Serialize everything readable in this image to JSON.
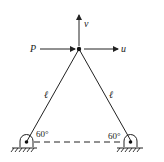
{
  "diagram": {
    "labels": {
      "v": "v",
      "u": "u",
      "P": "P",
      "left_member": "ℓ",
      "right_member": "ℓ",
      "left_angle": "60°",
      "right_angle": "60°"
    },
    "colors": {
      "line": "#222222"
    }
  }
}
